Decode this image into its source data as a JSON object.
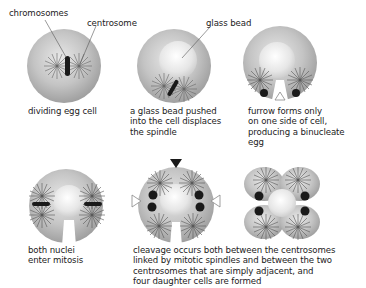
{
  "labels": {
    "chromosomes": "chromosomes",
    "centrosome": "centrosome",
    "glass_bead": "glass bead"
  },
  "panels": [
    {
      "id": "dividing-egg-cell",
      "caption": [
        "dividing egg cell"
      ]
    },
    {
      "id": "glass-bead-pushed",
      "caption": [
        "a glass bead pushed",
        "into the cell displaces",
        "the spindle"
      ]
    },
    {
      "id": "furrow-one-side",
      "caption": [
        "furrow forms only",
        "on one side of cell,",
        "producing a binucleate",
        "egg"
      ]
    },
    {
      "id": "both-nuclei-mitosis",
      "caption": [
        "both nuclei",
        "enter mitosis"
      ]
    },
    {
      "id": "cleavage-four-cells",
      "caption": [
        "cleavage occurs both between the centrosomes",
        "linked by mitotic spindles and between the two",
        "centrosomes that are simply adjacent, and",
        "four daughter cells are formed"
      ]
    }
  ],
  "colors": {
    "cell": "#bdbdbd",
    "bead": "#eeeeee",
    "chromatin": "#1a1a1a",
    "text": "#222222"
  }
}
